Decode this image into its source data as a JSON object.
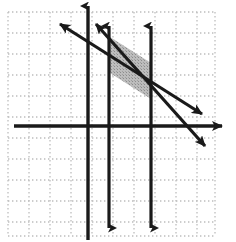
{
  "figure": {
    "title": "",
    "type": "coordinate-grid-inequality-graph",
    "width": 236,
    "height": 242,
    "background_color": "#ffffff"
  },
  "grid": {
    "style": "dotted",
    "dot_color": "#bdbdbd",
    "spacing_px": 21,
    "left": 8,
    "top": 12,
    "right": 215,
    "bottom": 236,
    "vertical_lines_x": [
      8,
      29,
      50,
      71,
      92,
      113,
      134,
      155,
      176,
      197,
      215
    ],
    "horizontal_lines_y": [
      12,
      33,
      54,
      75,
      96,
      117,
      138,
      159,
      180,
      201,
      222,
      236
    ]
  },
  "axes": {
    "color": "#1a1a1a",
    "stroke_width": 3.4,
    "x_axis": {
      "label": "x-axis",
      "y_px": 126,
      "x_start": 14,
      "x_end": 228,
      "arrow": "right"
    },
    "y_axis": {
      "label": "y-axis",
      "x_px": 88,
      "y_start": 2,
      "y_end": 240,
      "arrow": "up"
    }
  },
  "chart_data": {
    "type": "line",
    "title": "",
    "xlabel": "",
    "ylabel": "",
    "grid": true,
    "legend": "none",
    "lines": [
      {
        "name": "vertical-boundary-left",
        "orientation": "vertical",
        "x_px": 109,
        "y_top_px": 24,
        "y_bottom_px": 232,
        "arrow_top": true,
        "arrow_bottom": true,
        "color": "#1a1a1a",
        "stroke_width": 3.2
      },
      {
        "name": "vertical-boundary-right",
        "orientation": "vertical",
        "x_px": 151,
        "y_top_px": 24,
        "y_bottom_px": 232,
        "arrow_top": true,
        "arrow_bottom": true,
        "color": "#1a1a1a",
        "stroke_width": 3.2
      },
      {
        "name": "diagonal-upper",
        "orientation": "diagonal",
        "x1_px": 56,
        "y1_px": 22,
        "x2_px": 208,
        "y2_px": 118,
        "slope_sign": "negative",
        "arrow_start": true,
        "arrow_end": true,
        "color": "#1a1a1a",
        "stroke_width": 3.2
      },
      {
        "name": "diagonal-lower",
        "orientation": "diagonal",
        "x1_px": 93,
        "y1_px": 22,
        "x2_px": 211,
        "y2_px": 153,
        "slope_sign": "negative",
        "arrow_start": true,
        "arrow_end": true,
        "color": "#1a1a1a",
        "stroke_width": 3.2
      }
    ],
    "shaded_region": {
      "name": "solution-region",
      "shape": "parallelogram",
      "fill_color": "#b5b5b5",
      "fill_opacity": 0.85,
      "pattern": "stippled-gray",
      "vertices_px": [
        [
          110,
          37
        ],
        [
          151,
          63
        ],
        [
          151,
          99
        ],
        [
          110,
          73
        ]
      ]
    }
  }
}
